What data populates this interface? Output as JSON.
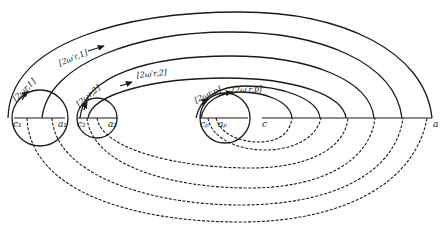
{
  "diagram": {
    "type": "orbit contour diagram",
    "points": {
      "c1": "c₁",
      "a1": "a₁",
      "c2": "c₂",
      "a2": "a₂",
      "cp": "cₚ",
      "ap": "aₚ",
      "c": "c",
      "a": "a"
    },
    "paths": {
      "p1": "[2ωr,1]",
      "p1prime": "[2ω′r,1]",
      "p2": "[2ωr,2]",
      "p2prime": "[2ω′r,2]",
      "pp": "[2ωr,p]",
      "ppprime": "[2ω′r,p]"
    },
    "colors": {
      "ink": "#1a1a1a",
      "background": "#ffffff"
    }
  }
}
